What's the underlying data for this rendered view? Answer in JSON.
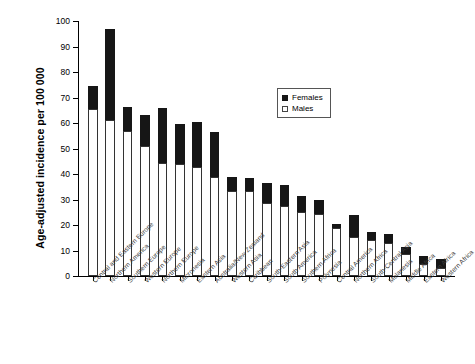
{
  "chart_data": {
    "type": "bar",
    "stacked": true,
    "title": "",
    "xlabel": "",
    "ylabel": "Age-adjusted incidence per 100 000",
    "ylim": [
      0,
      100
    ],
    "yticks": [
      0,
      10,
      20,
      30,
      40,
      50,
      60,
      70,
      80,
      90,
      100
    ],
    "grid": false,
    "legend_position": "upper-right-inside",
    "categories": [
      "Central and Eastern Europe",
      "Northern America",
      "Southern Europe",
      "Western Europe",
      "Northern Europe",
      "Micronesia",
      "Eastern Asia",
      "Australia/New Zealand",
      "Western Asia",
      "Caribbean",
      "South-Eastern Asia",
      "South America",
      "Southern Africa",
      "Polynesia",
      "Central America",
      "Northern Africa",
      "South-Central Asia",
      "Melanesia",
      "Middle Africa",
      "Eastern Africa",
      "Western Africa"
    ],
    "series": [
      {
        "name": "Males",
        "color": "#ffffff",
        "values": [
          65.5,
          61.0,
          56.8,
          50.8,
          44.3,
          44.1,
          42.6,
          39.0,
          33.2,
          33.2,
          28.6,
          27.6,
          25.0,
          24.3,
          19.0,
          15.4,
          14.1,
          12.8,
          8.5,
          4.8,
          3.0
        ]
      },
      {
        "name": "Females",
        "color": "#161616",
        "values": [
          9.0,
          36.0,
          9.4,
          12.3,
          21.4,
          15.5,
          17.8,
          17.5,
          5.5,
          5.3,
          8.0,
          8.0,
          6.4,
          5.6,
          1.5,
          8.7,
          3.0,
          3.5,
          3.0,
          3.2,
          3.5
        ]
      }
    ],
    "totals": [
      74.5,
      97.0,
      66.2,
      63.1,
      65.7,
      59.6,
      60.4,
      56.5,
      38.7,
      38.5,
      36.6,
      35.6,
      31.4,
      29.9,
      20.5,
      24.1,
      17.1,
      16.3,
      11.5,
      8.0,
      6.5
    ]
  },
  "legend": {
    "items": [
      {
        "label": "Females",
        "marker": "filled-square"
      },
      {
        "label": "Males",
        "marker": "open-square"
      }
    ]
  }
}
